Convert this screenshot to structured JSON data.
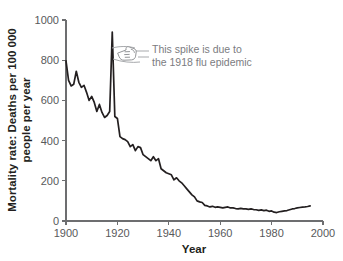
{
  "chart_data": {
    "type": "line",
    "title": "",
    "xlabel": "Year",
    "ylabel": "Mortality rate: Deaths per 100 000 people per year",
    "ylabel_line1": "Mortality rate: Deaths per 100 000",
    "ylabel_line2": "people per year",
    "xlim": [
      1900,
      2000
    ],
    "ylim": [
      0,
      1000
    ],
    "xticks": [
      1900,
      1920,
      1940,
      1960,
      1980,
      2000
    ],
    "xtick_labels": [
      "1900",
      "1920",
      "1940",
      "1960",
      "1980",
      "2000"
    ],
    "yticks": [
      0,
      200,
      400,
      600,
      800,
      1000
    ],
    "ytick_labels": [
      "0",
      "200",
      "400",
      "600",
      "800",
      "1000"
    ],
    "grid": false,
    "legend": "none",
    "line_color": "#231f20",
    "axis_color": "#6d6e70",
    "annotation_color": "#7b7c7f",
    "x": [
      1900,
      1901,
      1902,
      1903,
      1904,
      1905,
      1906,
      1907,
      1908,
      1909,
      1910,
      1911,
      1912,
      1913,
      1914,
      1915,
      1916,
      1917,
      1918,
      1919,
      1920,
      1921,
      1922,
      1923,
      1924,
      1925,
      1926,
      1927,
      1928,
      1929,
      1930,
      1931,
      1932,
      1933,
      1934,
      1935,
      1936,
      1937,
      1938,
      1939,
      1940,
      1941,
      1942,
      1943,
      1944,
      1945,
      1946,
      1947,
      1948,
      1949,
      1950,
      1951,
      1952,
      1953,
      1954,
      1955,
      1956,
      1957,
      1958,
      1959,
      1960,
      1961,
      1962,
      1963,
      1964,
      1965,
      1966,
      1967,
      1968,
      1969,
      1970,
      1971,
      1972,
      1973,
      1974,
      1975,
      1976,
      1977,
      1978,
      1979,
      1980,
      1981,
      1982,
      1983,
      1984,
      1985,
      1986,
      1987,
      1988,
      1989,
      1990,
      1991,
      1992,
      1993,
      1994,
      1995
    ],
    "values": [
      797,
      700,
      672,
      680,
      745,
      690,
      665,
      675,
      640,
      600,
      620,
      590,
      545,
      580,
      540,
      515,
      525,
      545,
      940,
      520,
      510,
      420,
      410,
      405,
      395,
      370,
      380,
      350,
      370,
      365,
      330,
      320,
      310,
      300,
      320,
      300,
      310,
      260,
      250,
      240,
      235,
      230,
      205,
      215,
      200,
      190,
      175,
      160,
      145,
      130,
      120,
      100,
      95,
      92,
      78,
      75,
      70,
      73,
      68,
      70,
      68,
      65,
      68,
      70,
      65,
      65,
      62,
      60,
      63,
      60,
      60,
      58,
      60,
      57,
      56,
      53,
      55,
      52,
      54,
      48,
      50,
      44,
      42,
      46,
      48,
      50,
      52,
      56,
      60,
      62,
      65,
      67,
      69,
      70,
      72,
      75
    ],
    "annotations": [
      {
        "id": "flu-spike",
        "line1": "This spike is due to",
        "line2": "the 1918 flu epidemic",
        "icon": "pointing-hand-icon",
        "target_year": 1918,
        "target_value": 940
      }
    ]
  }
}
